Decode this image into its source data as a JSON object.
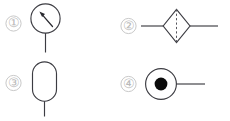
{
  "figure": {
    "background_color": "#ffffff",
    "line_color": "#3c3c42",
    "label_color": "#b9b9b9",
    "fill_color": "#0b0b0b",
    "caption": "",
    "items": [
      {
        "number": "1",
        "label": "①",
        "symbol_name": "pressure-gauge",
        "description": "circle with pointer needle and vertical connection line below"
      },
      {
        "number": "2",
        "label": "②",
        "symbol_name": "filter-separator-diamond",
        "description": "diamond with dashed vertical centre line and horizontal lines on both sides"
      },
      {
        "number": "3",
        "label": "③",
        "symbol_name": "vertical-capsule-vessel",
        "description": "vertical stadium/capsule outline with vertical line below"
      },
      {
        "number": "4",
        "label": "④",
        "symbol_name": "circle-with-filled-dot",
        "description": "circle containing a solid black dot with horizontal line to the right"
      }
    ]
  }
}
